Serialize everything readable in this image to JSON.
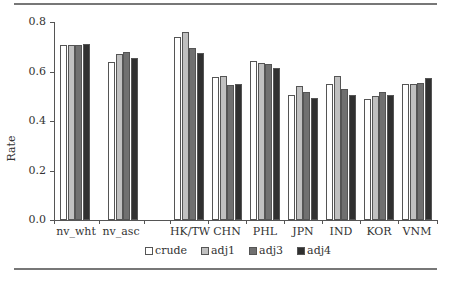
{
  "chart_data": {
    "type": "bar",
    "title": "",
    "xlabel": "",
    "ylabel": "Rate",
    "ylim": [
      0,
      0.8
    ],
    "yticks": [
      "0.0",
      "0.2",
      "0.4",
      "0.6",
      "0.8"
    ],
    "grid": false,
    "legend_position": "bottom",
    "categories": [
      "nv_wht",
      "nv_asc",
      "",
      "HK/TW",
      "CHN",
      "PHL",
      "JPN",
      "IND",
      "KOR",
      "VNM"
    ],
    "series": [
      {
        "name": "crude",
        "color": "#ffffff",
        "values": [
          0.707,
          0.638,
          null,
          0.74,
          0.578,
          0.642,
          0.505,
          0.55,
          0.489,
          0.55
        ]
      },
      {
        "name": "adj1",
        "color": "#c0c0c0",
        "values": [
          0.707,
          0.67,
          null,
          0.76,
          0.582,
          0.634,
          0.541,
          0.582,
          0.5,
          0.55
        ]
      },
      {
        "name": "adj3",
        "color": "#707070",
        "values": [
          0.707,
          0.68,
          null,
          0.695,
          0.545,
          0.63,
          0.517,
          0.529,
          0.517,
          0.554
        ]
      },
      {
        "name": "adj4",
        "color": "#303030",
        "values": [
          0.71,
          0.655,
          null,
          0.675,
          0.55,
          0.614,
          0.493,
          0.505,
          0.505,
          0.574
        ]
      }
    ]
  },
  "axis": {
    "ylabel": "Rate",
    "yticks": [
      "0.0",
      "0.2",
      "0.4",
      "0.6",
      "0.8"
    ]
  },
  "xlabels": [
    "nv_wht",
    "nv_asc",
    "HK/TW",
    "CHN",
    "PHL",
    "JPN",
    "IND",
    "KOR",
    "VNM"
  ],
  "legend": [
    "crude",
    "adj1",
    "adj3",
    "adj4"
  ]
}
